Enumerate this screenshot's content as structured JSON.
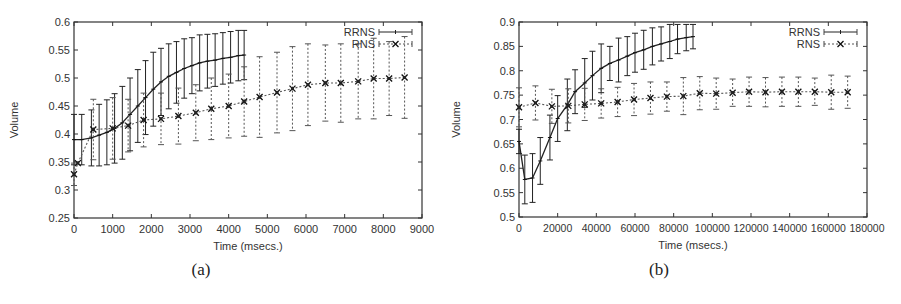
{
  "figures": [
    {
      "caption": "(a)",
      "title": "",
      "xlabel": "Time (msecs.)",
      "ylabel": "Volume",
      "legend": [
        "RRNS",
        "RNS"
      ]
    },
    {
      "caption": "(b)",
      "title": "",
      "xlabel": "Time (msecs.)",
      "ylabel": "Volume",
      "legend": [
        "RRNS",
        "RNS"
      ]
    }
  ],
  "chart_data": [
    {
      "type": "line",
      "title": "",
      "caption": "(a)",
      "xlabel": "Time (msecs.)",
      "ylabel": "Volume",
      "xlim": [
        0,
        9000
      ],
      "ylim": [
        0.25,
        0.6
      ],
      "xticks": [
        0,
        1000,
        2000,
        3000,
        4000,
        5000,
        6000,
        7000,
        8000,
        9000
      ],
      "xtick_labels": [
        "0",
        "1000",
        "2000",
        "3000",
        "4000",
        "5000",
        "6000",
        "7000",
        "8000",
        "9000"
      ],
      "yticks": [
        0.25,
        0.3,
        0.35,
        0.4,
        0.45,
        0.5,
        0.55,
        0.6
      ],
      "ytick_labels": [
        "0.25",
        "0.3",
        "0.35",
        "0.4",
        "0.45",
        "0.5",
        "0.55",
        "0.6"
      ],
      "grid": false,
      "legend_position": "top-right",
      "error_bars": true,
      "series": [
        {
          "name": "RRNS",
          "style": "solid",
          "marker": "plus",
          "x": [
            0,
            200,
            450,
            650,
            850,
            1050,
            1250,
            1450,
            1650,
            1850,
            2050,
            2250,
            2450,
            2650,
            2850,
            3050,
            3250,
            3450,
            3650,
            3850,
            4050,
            4250,
            4400
          ],
          "y": [
            0.39,
            0.39,
            0.393,
            0.398,
            0.403,
            0.41,
            0.42,
            0.435,
            0.45,
            0.465,
            0.48,
            0.493,
            0.503,
            0.51,
            0.517,
            0.522,
            0.527,
            0.53,
            0.532,
            0.535,
            0.537,
            0.54,
            0.541
          ],
          "err": [
            0.045,
            0.045,
            0.05,
            0.055,
            0.058,
            0.062,
            0.065,
            0.065,
            0.065,
            0.066,
            0.066,
            0.06,
            0.058,
            0.055,
            0.053,
            0.05,
            0.05,
            0.048,
            0.047,
            0.046,
            0.046,
            0.045,
            0.044
          ]
        },
        {
          "name": "RNS",
          "style": "dotted",
          "marker": "x-box",
          "x": [
            0,
            100,
            500,
            1000,
            1400,
            1800,
            2250,
            2700,
            3150,
            3550,
            4000,
            4400,
            4800,
            5250,
            5650,
            6050,
            6500,
            6900,
            7350,
            7750,
            8150,
            8550
          ],
          "y": [
            0.328,
            0.348,
            0.408,
            0.41,
            0.415,
            0.425,
            0.427,
            0.432,
            0.438,
            0.445,
            0.45,
            0.458,
            0.466,
            0.474,
            0.481,
            0.488,
            0.491,
            0.491,
            0.494,
            0.499,
            0.499,
            0.501
          ],
          "err": [
            0.02,
            0.0,
            0.054,
            0.055,
            0.047,
            0.048,
            0.046,
            0.05,
            0.05,
            0.055,
            0.057,
            0.062,
            0.072,
            0.072,
            0.075,
            0.073,
            0.068,
            0.07,
            0.067,
            0.072,
            0.066,
            0.073
          ]
        }
      ]
    },
    {
      "type": "line",
      "title": "",
      "caption": "(b)",
      "xlabel": "Time (msecs.)",
      "ylabel": "Volume",
      "xlim": [
        0,
        180000
      ],
      "ylim": [
        0.5,
        0.9
      ],
      "xticks": [
        0,
        20000,
        40000,
        60000,
        80000,
        100000,
        120000,
        140000,
        160000,
        180000
      ],
      "xtick_labels": [
        "0",
        "20000",
        "40000",
        "60000",
        "80000",
        "100000",
        "120000",
        "140000",
        "160000",
        "180000"
      ],
      "yticks": [
        0.5,
        0.55,
        0.6,
        0.65,
        0.7,
        0.75,
        0.8,
        0.85,
        0.9
      ],
      "ytick_labels": [
        "0.5",
        "0.55",
        "0.6",
        "0.65",
        "0.7",
        "0.75",
        "0.8",
        "0.85",
        "0.9"
      ],
      "grid": false,
      "legend_position": "top-right",
      "error_bars": true,
      "series": [
        {
          "name": "RRNS",
          "style": "solid",
          "marker": "plus",
          "x": [
            0,
            3000,
            7000,
            11000,
            16000,
            20000,
            25000,
            29000,
            34000,
            38000,
            42500,
            47000,
            51500,
            56000,
            60000,
            64500,
            69000,
            73500,
            78000,
            82000,
            86500,
            90000
          ],
          "y": [
            0.655,
            0.577,
            0.58,
            0.615,
            0.663,
            0.702,
            0.73,
            0.757,
            0.775,
            0.79,
            0.805,
            0.815,
            0.822,
            0.83,
            0.837,
            0.843,
            0.85,
            0.855,
            0.86,
            0.865,
            0.868,
            0.87
          ],
          "err": [
            0.025,
            0.05,
            0.05,
            0.048,
            0.046,
            0.047,
            0.053,
            0.045,
            0.05,
            0.05,
            0.05,
            0.035,
            0.045,
            0.04,
            0.04,
            0.04,
            0.038,
            0.035,
            0.035,
            0.03,
            0.027,
            0.025
          ]
        },
        {
          "name": "RNS",
          "style": "dotted",
          "marker": "x-box",
          "x": [
            0,
            8500,
            17000,
            25500,
            34000,
            42500,
            51000,
            59500,
            68000,
            76500,
            85000,
            93500,
            102000,
            110500,
            119000,
            127500,
            136000,
            144500,
            153000,
            161500,
            170000
          ],
          "y": [
            0.725,
            0.734,
            0.727,
            0.728,
            0.731,
            0.733,
            0.736,
            0.741,
            0.744,
            0.747,
            0.748,
            0.754,
            0.753,
            0.755,
            0.757,
            0.756,
            0.757,
            0.757,
            0.757,
            0.756,
            0.756
          ],
          "err": [
            0.04,
            0.035,
            0.035,
            0.035,
            0.033,
            0.03,
            0.03,
            0.033,
            0.033,
            0.03,
            0.038,
            0.034,
            0.032,
            0.028,
            0.03,
            0.03,
            0.03,
            0.03,
            0.028,
            0.035,
            0.033
          ]
        }
      ]
    }
  ]
}
